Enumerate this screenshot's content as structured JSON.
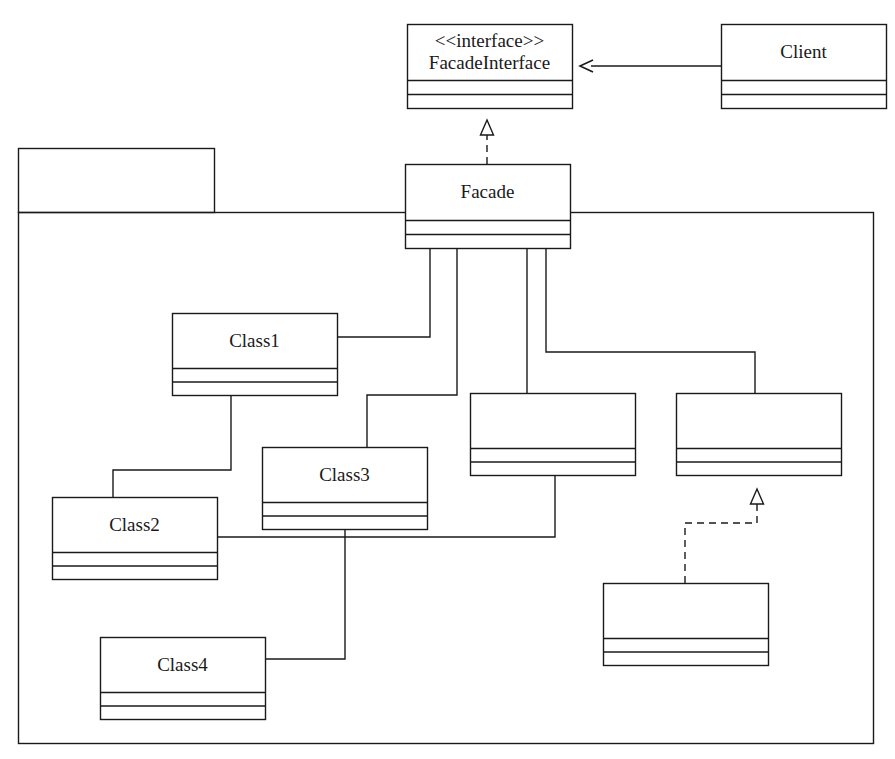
{
  "diagram": {
    "type": "uml-class-diagram",
    "background_color": "#ffffff",
    "line_color": "#1a1a1a",
    "text_color": "#1a1a1a"
  },
  "package": {
    "name": "",
    "tab": {
      "x": 18,
      "y": 148,
      "width": 196,
      "height": 64
    },
    "body": {
      "x": 18,
      "y": 212,
      "width": 855,
      "height": 531
    }
  },
  "classes": [
    {
      "id": "facade-interface",
      "stereotype": "<<interface>>",
      "name": "FacadeInterface",
      "x": 407,
      "y": 24,
      "width": 165,
      "height": 84,
      "header_height": 56,
      "compartments": 2
    },
    {
      "id": "client",
      "stereotype": "",
      "name": "Client",
      "x": 721,
      "y": 24,
      "width": 165,
      "height": 84,
      "header_height": 56,
      "compartments": 2
    },
    {
      "id": "facade",
      "stereotype": "",
      "name": "Facade",
      "x": 405,
      "y": 164,
      "width": 165,
      "height": 84,
      "header_height": 56,
      "compartments": 2
    },
    {
      "id": "class1",
      "stereotype": "",
      "name": "Class1",
      "x": 172,
      "y": 313,
      "width": 165,
      "height": 82,
      "header_height": 55,
      "compartments": 2
    },
    {
      "id": "class3",
      "stereotype": "",
      "name": "Class3",
      "x": 262,
      "y": 447,
      "width": 165,
      "height": 82,
      "header_height": 55,
      "compartments": 2
    },
    {
      "id": "class2",
      "stereotype": "",
      "name": "Class2",
      "x": 52,
      "y": 497,
      "width": 165,
      "height": 82,
      "header_height": 55,
      "compartments": 2
    },
    {
      "id": "class4",
      "stereotype": "",
      "name": "Class4",
      "x": 100,
      "y": 637,
      "width": 165,
      "height": 82,
      "header_height": 55,
      "compartments": 2
    },
    {
      "id": "unnamed-left",
      "stereotype": "",
      "name": "",
      "x": 470,
      "y": 393,
      "width": 165,
      "height": 82,
      "header_height": 55,
      "compartments": 2
    },
    {
      "id": "unnamed-right",
      "stereotype": "",
      "name": "",
      "x": 676,
      "y": 393,
      "width": 165,
      "height": 82,
      "header_height": 55,
      "compartments": 2
    },
    {
      "id": "unnamed-bottom",
      "stereotype": "",
      "name": "",
      "x": 603,
      "y": 583,
      "width": 165,
      "height": 82,
      "header_height": 55,
      "compartments": 2
    }
  ],
  "connections": [
    {
      "id": "client-to-facadeinterface",
      "kind": "association-arrow",
      "style": "solid",
      "arrow": "open-arrow",
      "from": "client",
      "to": "facade-interface",
      "points": "721,66 580,66"
    },
    {
      "id": "facade-realizes-facadeinterface",
      "kind": "realization",
      "style": "dashed",
      "arrow": "hollow-triangle",
      "from": "facade",
      "to": "facade-interface",
      "points": "487,164 487,120"
    },
    {
      "id": "facade-to-class1",
      "kind": "association",
      "style": "solid",
      "arrow": "none",
      "from": "facade",
      "to": "class1",
      "points": "430,248 430,337 337,337"
    },
    {
      "id": "facade-to-class3",
      "kind": "association",
      "style": "solid",
      "arrow": "none",
      "from": "facade",
      "to": "class3",
      "points": "457,248 457,395 367,395 367,447"
    },
    {
      "id": "facade-to-unnamed-left",
      "kind": "association",
      "style": "solid",
      "arrow": "none",
      "from": "facade",
      "to": "unnamed-left",
      "points": "527,248 527,393"
    },
    {
      "id": "facade-to-unnamed-right",
      "kind": "association",
      "style": "solid",
      "arrow": "none",
      "from": "facade",
      "to": "unnamed-right",
      "points": "546,248 546,352 755,352 755,393"
    },
    {
      "id": "class1-to-class2",
      "kind": "association",
      "style": "solid",
      "arrow": "none",
      "from": "class1",
      "to": "class2",
      "points": "231,395 231,470 113,470 113,497"
    },
    {
      "id": "class2-to-unnamed-left",
      "kind": "association",
      "style": "solid",
      "arrow": "none",
      "from": "class2",
      "to": "unnamed-left",
      "points": "217,537 555,537 555,475"
    },
    {
      "id": "class3-to-class4",
      "kind": "association",
      "style": "solid",
      "arrow": "none",
      "from": "class3",
      "to": "class4",
      "points": "345,529 345,659 265,659"
    },
    {
      "id": "unnamed-bottom-realizes-unnamed-right",
      "kind": "realization",
      "style": "dashed",
      "arrow": "hollow-triangle",
      "from": "unnamed-bottom",
      "to": "unnamed-right",
      "points": "685,583 685,523 757,523 757,489"
    }
  ]
}
